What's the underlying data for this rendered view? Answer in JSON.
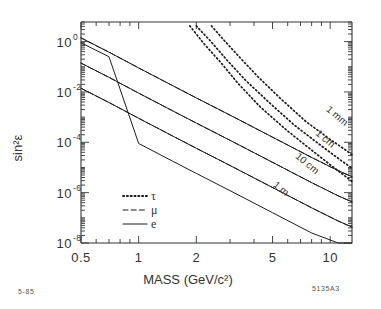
{
  "figure": {
    "stamp_left": "5-85",
    "stamp_right": "5135A3"
  },
  "chart_data": {
    "type": "line",
    "title": "",
    "xlabel": "MASS",
    "xunit": "(GeV/c²)",
    "ylabel": "sin²ε",
    "xscale": "log",
    "yscale": "log",
    "xlim": [
      0.5,
      13
    ],
    "ylim": [
      1e-08,
      6
    ],
    "grid": false,
    "xticks": [
      0.5,
      1,
      2,
      5,
      10
    ],
    "xtick_labels": [
      "0.5",
      "1",
      "2",
      "5",
      "10"
    ],
    "yticks": [
      1,
      0.01,
      0.0001,
      1e-06,
      1e-08
    ],
    "ytick_mantissa": [
      "10",
      "10",
      "10",
      "10",
      "10"
    ],
    "ytick_exponents": [
      "0",
      "-2",
      "-4",
      "-6",
      "-8"
    ],
    "legend": {
      "position": "lower-left-inside",
      "entries": [
        {
          "label": "τ",
          "style": "dotted"
        },
        {
          "label": "μ",
          "style": "dashed"
        },
        {
          "label": "e",
          "style": "solid"
        }
      ]
    },
    "annotations": [
      {
        "text": "1 mm",
        "x": 10.6,
        "y": 0.0009
      },
      {
        "text": "1 cm",
        "x": 9.2,
        "y": 0.00011
      },
      {
        "text": "10 cm",
        "x": 7.4,
        "y": 1.15e-05
      },
      {
        "text": "1 m",
        "x": 5.4,
        "y": 1.15e-06
      }
    ],
    "series": [
      {
        "name": "e-1mm",
        "particle": "e",
        "decay_length": "1 mm",
        "style": "solid",
        "x": [
          0.5,
          0.7,
          1.0,
          1.5,
          2.0,
          3.0,
          5.0,
          8.0,
          11.0,
          13.0
        ],
        "y": [
          1.4,
          0.38,
          0.09,
          0.018,
          0.0058,
          0.0012,
          0.00016,
          2.5e-05,
          7.5e-06,
          4.3e-06
        ]
      },
      {
        "name": "mu-1mm",
        "particle": "μ",
        "decay_length": "1 mm",
        "style": "dashed",
        "x": [
          0.5,
          0.7,
          1.0,
          1.5,
          2.0,
          3.0,
          5.0,
          8.0,
          11.0,
          13.0
        ],
        "y": [
          1.4,
          0.38,
          0.09,
          0.018,
          0.0058,
          0.0012,
          0.00016,
          2.5e-05,
          7.5e-06,
          4.3e-06
        ]
      },
      {
        "name": "e-1cm",
        "particle": "e",
        "decay_length": "1 cm",
        "style": "solid",
        "x": [
          0.5,
          0.7,
          1.0,
          1.5,
          2.0,
          3.0,
          5.0,
          8.0,
          11.0,
          13.0
        ],
        "y": [
          0.14,
          0.038,
          0.009,
          0.0018,
          0.00058,
          0.00012,
          1.6e-05,
          2.5e-06,
          7.5e-07,
          4.3e-07
        ]
      },
      {
        "name": "mu-1cm",
        "particle": "μ",
        "decay_length": "1 cm",
        "style": "dashed",
        "x": [
          0.5,
          0.7,
          1.0,
          1.5,
          2.0,
          3.0,
          5.0,
          8.0,
          11.0,
          13.0
        ],
        "y": [
          0.14,
          0.038,
          0.009,
          0.0018,
          0.00058,
          0.00012,
          1.6e-05,
          2.5e-06,
          7.5e-07,
          4.3e-07
        ]
      },
      {
        "name": "e-10cm",
        "particle": "e",
        "decay_length": "10 cm",
        "style": "solid",
        "x": [
          0.5,
          0.7,
          1.0,
          1.5,
          2.0,
          3.0,
          5.0,
          8.0,
          11.0,
          13.0
        ],
        "y": [
          0.014,
          0.0038,
          0.0009,
          0.00018,
          5.8e-05,
          1.2e-05,
          1.6e-06,
          2.5e-07,
          7.5e-08,
          4.3e-08
        ]
      },
      {
        "name": "mu-10cm",
        "particle": "μ",
        "decay_length": "10 cm",
        "style": "dashed",
        "x": [
          0.5,
          0.7,
          1.0,
          1.5,
          2.0,
          3.0,
          5.0,
          8.0,
          11.0,
          13.0
        ],
        "y": [
          0.014,
          0.0038,
          0.0009,
          0.00018,
          5.8e-05,
          1.2e-05,
          1.6e-06,
          2.5e-07,
          7.5e-08,
          4.3e-08
        ]
      },
      {
        "name": "e-1m",
        "particle": "e",
        "decay_length": "1 m",
        "style": "solid",
        "x": [
          0.5,
          0.7,
          1.0,
          1.5,
          2.0,
          3.0,
          5.0,
          8.0,
          11.0,
          13.0
        ],
        "y": [
          0.9,
          0.25,
          9e-05,
          1.8e-05,
          5.8e-06,
          1.2e-06,
          1.6e-07,
          2.5e-08,
          7.5e-09,
          4.3e-09
        ]
      },
      {
        "name": "tau-1mm",
        "particle": "τ",
        "decay_length": "1 mm",
        "style": "dotted",
        "x": [
          2.4,
          2.8,
          3.4,
          4.2,
          5.5,
          7.5,
          10.0,
          12.0,
          13.0
        ],
        "y": [
          4.2,
          1.1,
          0.22,
          0.04,
          0.0055,
          0.00065,
          0.00013,
          5e-05,
          3.2e-05
        ]
      },
      {
        "name": "tau-1cm",
        "particle": "τ",
        "decay_length": "1 cm",
        "style": "dotted",
        "x": [
          2.0,
          2.4,
          2.9,
          3.6,
          4.8,
          6.5,
          9.0,
          11.5,
          13.0
        ],
        "y": [
          4.2,
          0.95,
          0.18,
          0.03,
          0.0038,
          0.00048,
          7.2e-05,
          1.8e-05,
          9.5e-06
        ]
      },
      {
        "name": "tau-10cm",
        "particle": "τ",
        "decay_length": "10 cm",
        "style": "dotted",
        "x": [
          1.85,
          2.2,
          2.7,
          3.3,
          4.3,
          5.9,
          8.2,
          10.8,
          13.0
        ],
        "y": [
          4.2,
          0.8,
          0.14,
          0.022,
          0.0026,
          0.00031,
          4.2e-05,
          8.2e-06,
          2.8e-06
        ]
      }
    ]
  }
}
